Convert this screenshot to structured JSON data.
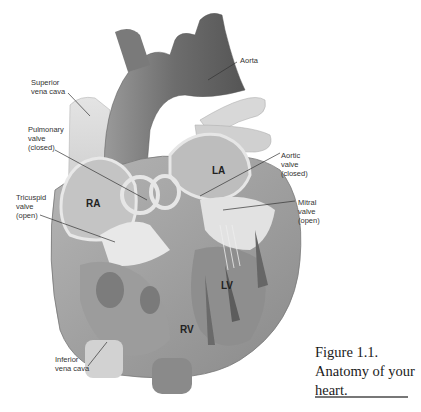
{
  "diagram": {
    "labels": [
      {
        "id": "aorta",
        "text": "Aorta"
      },
      {
        "id": "superior-vena-cava",
        "text": "Superior\nvena cava"
      },
      {
        "id": "pulmonary-valve",
        "text": "Pulmonary\nvalve\n(closed)"
      },
      {
        "id": "aortic-valve",
        "text": "Aortic\nvalve\n(closed)"
      },
      {
        "id": "tricuspid-valve",
        "text": "Tricuspid\nvalve\n(open)"
      },
      {
        "id": "mitral-valve",
        "text": "Mitral\nvalve\n(open)"
      },
      {
        "id": "inferior-vena-cava",
        "text": "Inferior\nvena cava"
      }
    ],
    "chambers": [
      {
        "id": "ra",
        "text": "RA"
      },
      {
        "id": "la",
        "text": "LA"
      },
      {
        "id": "lv",
        "text": "LV"
      },
      {
        "id": "rv",
        "text": "RV"
      }
    ]
  },
  "caption": {
    "text": "Figure 1.1. Anatomy of your heart."
  }
}
